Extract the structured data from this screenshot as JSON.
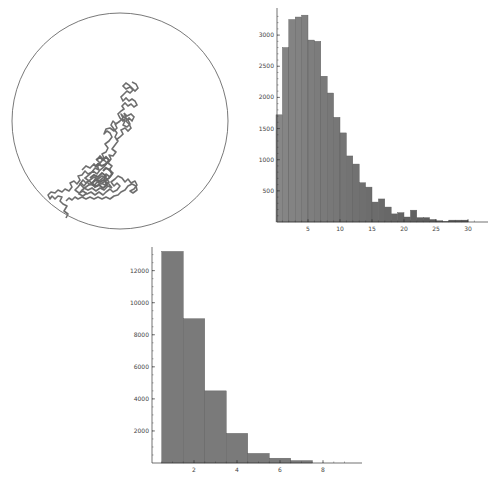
{
  "colors": {
    "circle_stroke": "#555555",
    "walk_stroke": "#6e6e6e",
    "bar_fill": "#7a7a7a",
    "bar_edge": "#5a5a5a",
    "axis": "#333333"
  },
  "chart_data": [
    {
      "type": "scatter",
      "title": "",
      "description": "2D random walk path drawn inside a circular boundary; path originates near the lower-left edge of the circle and wanders toward the center",
      "xlabel": "",
      "ylabel": "",
      "boundary": {
        "shape": "circle",
        "center_px": [
          120,
          121
        ],
        "radius_px": 108
      },
      "grid": false
    },
    {
      "type": "bar",
      "title": "",
      "xlabel": "",
      "ylabel": "",
      "bin_width": 1,
      "categories": [
        1,
        2,
        3,
        4,
        5,
        6,
        7,
        8,
        9,
        10,
        11,
        12,
        13,
        14,
        15,
        16,
        17,
        18,
        19,
        20,
        21,
        22,
        23,
        24,
        25,
        26,
        27,
        28,
        29,
        30
      ],
      "values": [
        1720,
        2800,
        3250,
        3290,
        3320,
        2920,
        2900,
        2340,
        2070,
        1680,
        1430,
        1060,
        930,
        630,
        560,
        320,
        370,
        240,
        130,
        150,
        80,
        190,
        70,
        70,
        40,
        20,
        10,
        30,
        30,
        30
      ],
      "xticks": [
        5,
        10,
        15,
        20,
        25,
        30
      ],
      "yticks": [
        500,
        1000,
        1500,
        2000,
        2500,
        3000
      ],
      "xlim": [
        0,
        32
      ],
      "ylim": [
        0,
        3400
      ],
      "grid": false
    },
    {
      "type": "bar",
      "title": "",
      "xlabel": "",
      "ylabel": "",
      "bin_width": 1,
      "categories": [
        1,
        2,
        3,
        4,
        5,
        6,
        7
      ],
      "values": [
        13200,
        9000,
        4500,
        1850,
        600,
        300,
        150
      ],
      "xticks": [
        2,
        4,
        6,
        8
      ],
      "yticks": [
        2000,
        4000,
        6000,
        8000,
        10000,
        12000
      ],
      "xlim": [
        0,
        9.5
      ],
      "ylim": [
        0,
        13500
      ],
      "grid": false
    }
  ],
  "labels": {
    "top_x": [
      "5",
      "10",
      "15",
      "20",
      "25",
      "30"
    ],
    "top_y": [
      "500",
      "1000",
      "1500",
      "2000",
      "2500",
      "3000"
    ],
    "bottom_x": [
      "2",
      "4",
      "6",
      "8"
    ],
    "bottom_y": [
      "2000",
      "4000",
      "6000",
      "8000",
      "10000",
      "12000"
    ]
  }
}
